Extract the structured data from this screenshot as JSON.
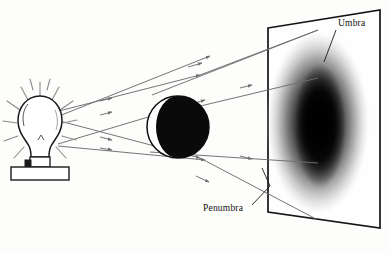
{
  "figure": {
    "background_color": "#fdfdfc",
    "ink_color": "#1a1a1a",
    "ray_color": "#6e6e6e"
  },
  "labels": {
    "umbra": "Umbra",
    "penumbra": "Penumbra"
  },
  "objects": {
    "light_source": {
      "name": "light-bulb",
      "glow_ray_count": 12,
      "bulb_center_x": 40,
      "bulb_center_y": 127,
      "bulb_radius": 20
    },
    "occluder": {
      "name": "sphere",
      "center_x": 178,
      "center_y": 127,
      "radius": 31,
      "lit_side": "left",
      "dark_side": "right"
    },
    "screen": {
      "name": "projection-screen",
      "corners": "268,28 380,10 380,228 268,212"
    },
    "shadow": {
      "name": "shadow-ellipse",
      "center_x": 318,
      "center_y": 123,
      "radius_x": 52,
      "radius_y": 93,
      "umbra_darkness": "#000000",
      "penumbra_fade": "#ffffff"
    }
  },
  "rays": {
    "count": 6,
    "arrowheads": true,
    "description": "Straight light rays from bulb past sphere edges onto screen"
  }
}
